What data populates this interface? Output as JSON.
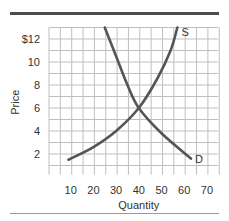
{
  "chart_data": {
    "type": "line",
    "title": "",
    "xlabel": "Quantity",
    "ylabel": "Price",
    "xlim": [
      0,
      75
    ],
    "ylim": [
      0,
      13
    ],
    "grid": true,
    "x_ticks": [
      10,
      20,
      30,
      40,
      50,
      60,
      70
    ],
    "y_ticks": [
      2,
      4,
      6,
      8,
      10,
      12
    ],
    "y_tick_labels": [
      "2",
      "4",
      "6",
      "8",
      "10",
      "$12"
    ],
    "series": [
      {
        "name": "S",
        "label": "S",
        "points": [
          [
            9,
            1.5
          ],
          [
            20,
            2.6
          ],
          [
            30,
            4.0
          ],
          [
            40,
            6.0
          ],
          [
            48,
            8.5
          ],
          [
            54,
            11
          ],
          [
            57,
            13
          ]
        ]
      },
      {
        "name": "D",
        "label": "D",
        "points": [
          [
            25,
            13
          ],
          [
            30,
            10.5
          ],
          [
            35,
            8.0
          ],
          [
            40,
            6.0
          ],
          [
            50,
            3.8
          ],
          [
            63,
            1.6
          ]
        ]
      }
    ],
    "annotations": [
      "S",
      "D"
    ],
    "equilibrium": {
      "quantity": 40,
      "price": 6
    },
    "colors": {
      "curve": "#555555",
      "grid": "#bfbfbf",
      "rule": "#4d4d4d"
    }
  }
}
